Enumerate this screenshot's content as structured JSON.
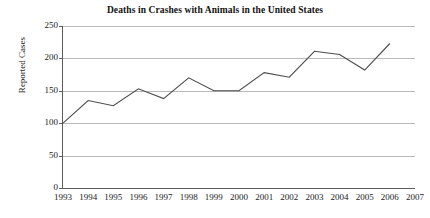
{
  "chart_data": {
    "type": "line",
    "title": "Deaths in Crashes with Animals in the United States",
    "xlabel": "",
    "ylabel": "Reported Cases",
    "x": [
      1993,
      1994,
      1995,
      1996,
      1997,
      1998,
      1999,
      2000,
      2001,
      2002,
      2003,
      2004,
      2005,
      2006
    ],
    "values": [
      100,
      135,
      127,
      153,
      138,
      170,
      150,
      150,
      178,
      171,
      211,
      206,
      182,
      223
    ],
    "series": [
      {
        "name": "Reported Cases",
        "values": [
          100,
          135,
          127,
          153,
          138,
          170,
          150,
          150,
          178,
          171,
          211,
          206,
          182,
          223
        ]
      }
    ],
    "xlim": [
      1993,
      2007
    ],
    "ylim": [
      0,
      250
    ],
    "x_tick_labels": [
      "1993",
      "1994",
      "1995",
      "1996",
      "1997",
      "1998",
      "1999",
      "2000",
      "2001",
      "2002",
      "2003",
      "2004",
      "2005",
      "2006",
      "2007"
    ],
    "y_tick_labels": [
      "0",
      "50",
      "100",
      "150",
      "200",
      "250"
    ],
    "y_ticks": [
      0,
      50,
      100,
      150,
      200,
      250
    ],
    "grid": "horizontal",
    "legend": "none",
    "line_color": "#4a4a4a",
    "grid_color": "#b9b9b9",
    "axis_color": "#5b5b5b"
  }
}
